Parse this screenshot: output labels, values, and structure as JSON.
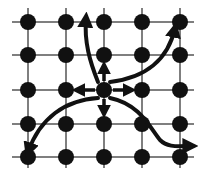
{
  "diagram": {
    "type": "grid-graph",
    "colors": {
      "background": "#ffffff",
      "grid_line": "#555555",
      "node": "#111111",
      "arrow": "#111111"
    },
    "grid": {
      "columns_x": [
        28,
        66,
        104,
        142,
        180
      ],
      "rows_y": [
        22,
        55,
        90,
        124,
        157
      ],
      "line_extent": {
        "x_min": 12,
        "x_max": 194,
        "y_min": 8,
        "y_max": 168
      },
      "node_radius": 8
    },
    "center_node": {
      "col": 2,
      "row": 2
    },
    "straight_arrows": [
      {
        "direction": "up",
        "to": {
          "col": 2,
          "row": 1
        }
      },
      {
        "direction": "down",
        "to": {
          "col": 2,
          "row": 3
        }
      },
      {
        "direction": "left",
        "to": {
          "col": 1,
          "row": 2
        }
      },
      {
        "direction": "right",
        "to": {
          "col": 3,
          "row": 2
        }
      }
    ],
    "curved_arrows": [
      {
        "name": "to-top-middle-left",
        "path": "M98 82 C 90 62, 84 42, 86 18"
      },
      {
        "name": "to-top-right",
        "path": "M110 82 C 145 78, 168 60, 175 28"
      },
      {
        "name": "to-bottom-left",
        "path": "M98 98 C 65 100, 40 118, 28 152"
      },
      {
        "name": "to-bottom-right",
        "path": "M110 98 C 140 104, 150 128, 160 140 C 168 148, 178 146, 192 146"
      }
    ]
  }
}
